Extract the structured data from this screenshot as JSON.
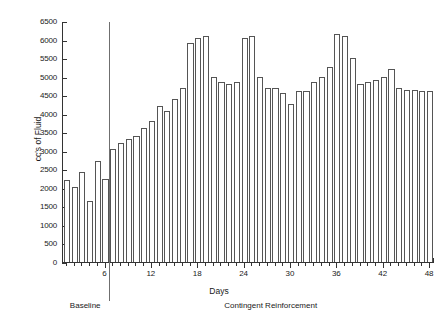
{
  "chart_data": {
    "type": "bar",
    "title": "",
    "xlabel": "Days",
    "ylabel": "cc's of Fluid",
    "ylim": [
      0,
      6500
    ],
    "ytick_step": 500,
    "ytick_labels": [
      "0",
      "500",
      "1000",
      "1500",
      "2000",
      "2500",
      "3000",
      "3500",
      "4000",
      "4500",
      "5000",
      "5500",
      "6000",
      "6500"
    ],
    "xlim": [
      0,
      48
    ],
    "xtick_labels": [
      "6",
      "12",
      "18",
      "24",
      "30",
      "36",
      "42",
      "48"
    ],
    "xtick_values": [
      6,
      12,
      18,
      24,
      30,
      36,
      42,
      48
    ],
    "grid": false,
    "legend": "none",
    "bar_style": "outlined-white",
    "categories": [
      1,
      2,
      3,
      4,
      5,
      6,
      7,
      8,
      9,
      10,
      11,
      12,
      13,
      14,
      15,
      16,
      17,
      18,
      19,
      20,
      21,
      22,
      23,
      24,
      25,
      26,
      27,
      28,
      29,
      30,
      31,
      32,
      33,
      34,
      35,
      36,
      37,
      38,
      39,
      40,
      41,
      42,
      43,
      44,
      45,
      46,
      47,
      48
    ],
    "values": [
      2200,
      2020,
      2420,
      1640,
      2720,
      2240,
      3040,
      3220,
      3320,
      3400,
      3620,
      3800,
      4220,
      4080,
      4400,
      4700,
      5900,
      6050,
      6100,
      5000,
      4850,
      4800,
      4850,
      6050,
      6100,
      5000,
      4700,
      4700,
      4550,
      4250,
      4600,
      4600,
      4850,
      5000,
      5250,
      6150,
      6100,
      5500,
      4800,
      4850,
      4900,
      5000,
      5200,
      4700,
      4650,
      4650,
      4600,
      4600
    ],
    "annotations": {
      "phases": [
        {
          "label": "Baseline",
          "start_day": 1,
          "end_day": 6
        },
        {
          "label": "Contingent Reinforcement",
          "start_day": 7,
          "end_day": 48
        }
      ],
      "divider_after_day": 6
    },
    "colors": {
      "bar_fill": "#ffffff",
      "bar_stroke": "#555555",
      "axis": "#333333",
      "divider": "#6f6f6f",
      "text": "#1a1a1a",
      "background": "#ffffff"
    }
  },
  "axes": {
    "y_title": "cc's of Fluid",
    "x_title": "Days"
  },
  "phase_labels": {
    "baseline": "Baseline",
    "contingent": "Contingent Reinforcement"
  }
}
